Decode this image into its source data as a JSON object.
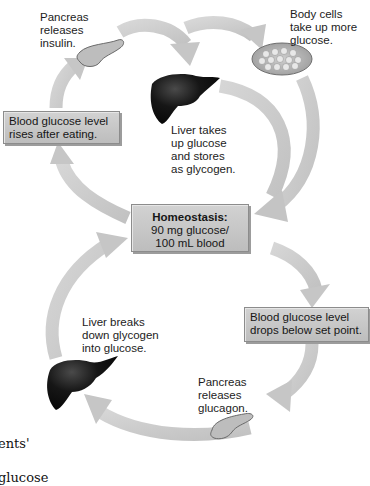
{
  "diagram": {
    "center": {
      "title": "Homeostasis:",
      "line2": "90 mg glucose/",
      "line3": "100 mL blood"
    },
    "rise_box": {
      "line1": "Blood glucose level",
      "line2": "rises after eating."
    },
    "drop_box": {
      "line1": "Blood glucose level",
      "line2": "drops below set point."
    },
    "labels": {
      "pancreas_insulin": "Pancreas\nreleases\ninsulin.",
      "body_cells": "Body cells\ntake up more\nglucose.",
      "liver_stores": "Liver takes\nup glucose\nand stores\nas glycogen.",
      "liver_breaks": "Liver breaks\ndown glycogen\ninto glucose.",
      "pancreas_glucagon": "Pancreas\nreleases\nglucagon."
    },
    "cut_off_text": {
      "line1": "ents'",
      "line2": "glucose"
    },
    "icons": {
      "pancreas_top": "pancreas-icon",
      "liver_top": "liver-icon",
      "body_cells": "cells-icon",
      "liver_bottom": "liver-icon",
      "pancreas_bottom": "pancreas-icon"
    },
    "colors": {
      "arrow": "#c8c8c8",
      "box_fill": "#c6c6c6",
      "box_border": "#8c8c8c",
      "organ_dark": "#111111",
      "pancreas_fill": "#b9b9b9"
    }
  }
}
